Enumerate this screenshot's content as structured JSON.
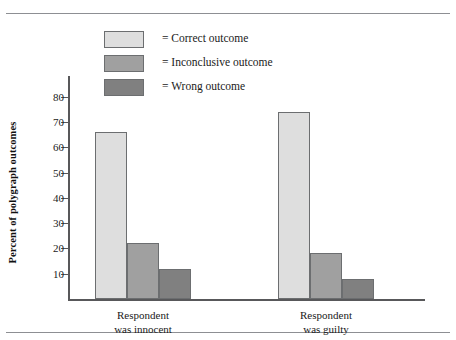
{
  "chart_data": {
    "type": "bar",
    "title": "",
    "subtitle": "",
    "xlabel": "",
    "ylabel": "Percent of polygraph outcomes",
    "ylim": [
      0,
      85
    ],
    "yticks": [
      10,
      20,
      30,
      40,
      50,
      60,
      70,
      80
    ],
    "ytick_labels": [
      "10",
      "20",
      "30",
      "40",
      "50",
      "60",
      "70",
      "80"
    ],
    "grid": false,
    "legend_position": "top-center",
    "categories": [
      "Respondent was innocent",
      "Respondent was guilty"
    ],
    "category_lines": [
      [
        "Respondent",
        "was innocent"
      ],
      [
        "Respondent",
        "was guilty"
      ]
    ],
    "series": [
      {
        "name": "= Correct outcome",
        "values": [
          66,
          74
        ],
        "color": "#dedede"
      },
      {
        "name": "= Inconclusive outcome",
        "values": [
          22,
          18
        ],
        "color": "#a0a0a0"
      },
      {
        "name": "= Wrong outcome",
        "values": [
          12,
          8
        ],
        "color": "#808080"
      }
    ]
  },
  "legend": {
    "items": [
      {
        "label": "= Correct outcome",
        "swatch": "legend-swatch-correct"
      },
      {
        "label": "= Inconclusive outcome",
        "swatch": "legend-swatch-inconclusive"
      },
      {
        "label": "= Wrong outcome",
        "swatch": "legend-swatch-wrong"
      }
    ]
  }
}
